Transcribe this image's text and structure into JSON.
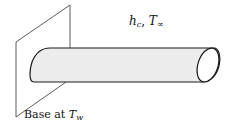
{
  "diagram": {
    "labels": {
      "convection_h": "h",
      "convection_h_sub": "c",
      "separator": ", ",
      "ambient_T": "T",
      "ambient_T_sub": "∞",
      "base_prefix": "Base at ",
      "base_T": "T",
      "base_T_sub": "w"
    },
    "colors": {
      "fin_fill": "#ececec",
      "stroke": "#1a1a1a",
      "wall_stroke": "#333333"
    }
  }
}
